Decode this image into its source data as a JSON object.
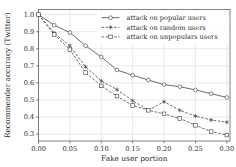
{
  "chart_data": {
    "type": "line",
    "title": "",
    "xlabel": "Fake user portion",
    "ylabel": "Recommender accuracy (Twitter)",
    "xlim": [
      0.0,
      0.305
    ],
    "ylim": [
      0.26,
      1.03
    ],
    "xticks": [
      "0.00",
      "0.05",
      "0.10",
      "0.15",
      "0.20",
      "0.25",
      "0.30"
    ],
    "xtick_values": [
      0.0,
      0.05,
      0.1,
      0.15,
      0.2,
      0.25,
      0.3
    ],
    "yticks": [
      "0.3",
      "0.4",
      "0.5",
      "0.6",
      "0.7",
      "0.8",
      "0.9",
      "1.0"
    ],
    "ytick_values": [
      0.3,
      0.4,
      0.5,
      0.6,
      0.7,
      0.8,
      0.9,
      1.0
    ],
    "grid": true,
    "legend_position": "top-right",
    "x": [
      0.0,
      0.025,
      0.05,
      0.075,
      0.1,
      0.125,
      0.15,
      0.175,
      0.2,
      0.225,
      0.25,
      0.275,
      0.3
    ],
    "series": [
      {
        "name": "attack on popular users",
        "marker": "circle",
        "linestyle": "solid",
        "color": "#3a3a3a",
        "values": [
          1.0,
          0.938,
          0.895,
          0.818,
          0.752,
          0.676,
          0.645,
          0.617,
          0.59,
          0.578,
          0.559,
          0.537,
          0.515
        ]
      },
      {
        "name": "attack on random users",
        "marker": "star",
        "linestyle": "dashed",
        "color": "#3a3a3a",
        "values": [
          1.0,
          0.892,
          0.818,
          0.694,
          0.612,
          0.561,
          0.496,
          0.44,
          0.49,
          0.44,
          0.406,
          0.383,
          0.37
        ]
      },
      {
        "name": "attack on unpopulars users",
        "marker": "square",
        "linestyle": "dashed",
        "color": "#3a3a3a",
        "values": [
          1.0,
          0.884,
          0.795,
          0.661,
          0.583,
          0.523,
          0.468,
          0.44,
          0.419,
          0.392,
          0.352,
          0.315,
          0.295
        ]
      }
    ]
  },
  "axes": {
    "x_title": "Fake user portion",
    "y_title": "Recommender accuracy (Twitter)"
  },
  "legend": {
    "entries": [
      {
        "label": "attack on popular users"
      },
      {
        "label": "attack on random users"
      },
      {
        "label": "attack on unpopulars users"
      }
    ]
  },
  "colors": {
    "line": "#3a3a3a",
    "grid": "#cfcfcf",
    "axis": "#4a4a4a",
    "text": "#2b2b2b",
    "background": "#ffffff"
  }
}
